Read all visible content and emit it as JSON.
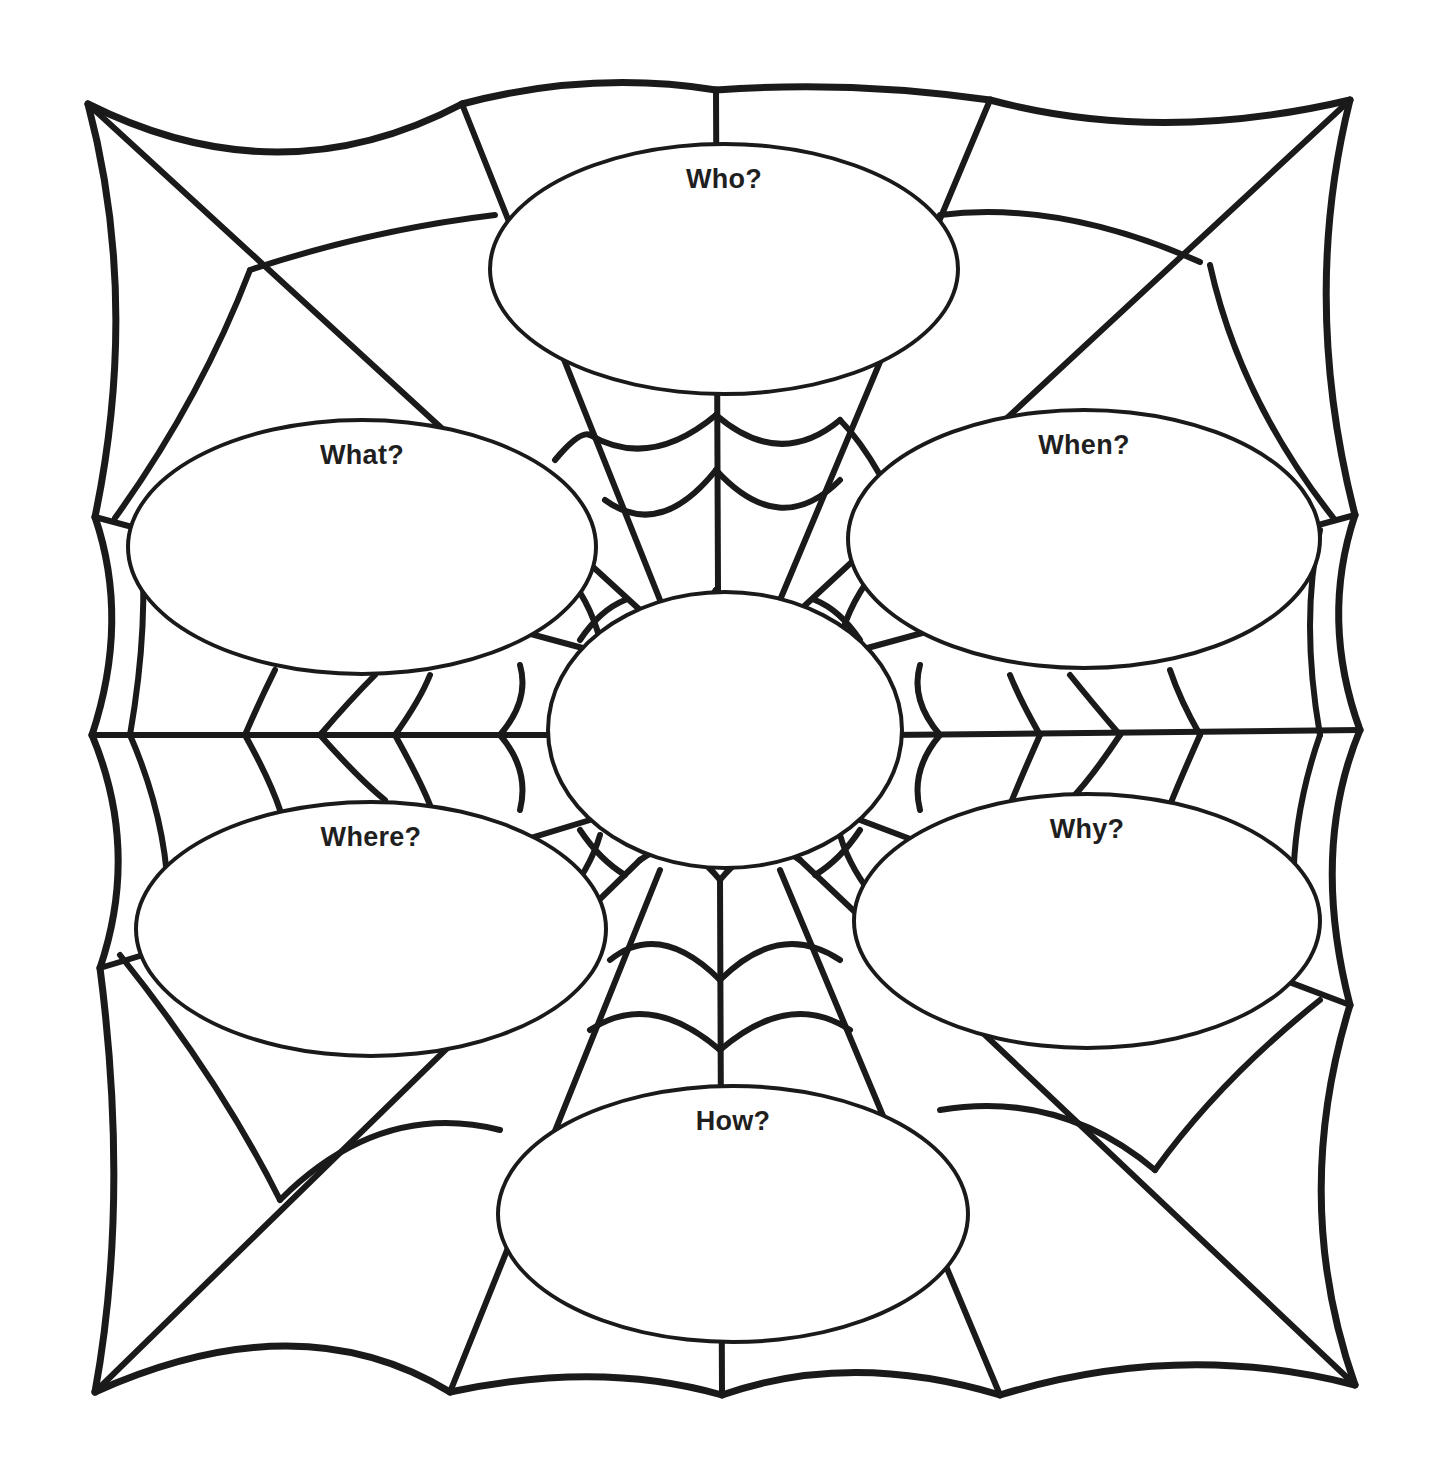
{
  "diagram": {
    "type": "spider web graphic organizer",
    "center": {
      "label": ""
    },
    "nodes": [
      {
        "id": "who",
        "label": "Who?"
      },
      {
        "id": "what",
        "label": "What?"
      },
      {
        "id": "when",
        "label": "When?"
      },
      {
        "id": "where",
        "label": "Where?"
      },
      {
        "id": "why",
        "label": "Why?"
      },
      {
        "id": "how",
        "label": "How?"
      }
    ]
  },
  "colors": {
    "ink": "#1a1a1a",
    "paper": "#ffffff"
  }
}
